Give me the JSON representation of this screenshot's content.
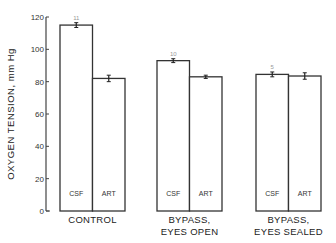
{
  "chart_data": {
    "type": "bar",
    "title": "",
    "xlabel": "",
    "ylabel": "OXYGEN TENSION, mm Hg",
    "ylim": [
      0,
      120
    ],
    "yticks": [
      0,
      20,
      40,
      60,
      80,
      100,
      120
    ],
    "grid": false,
    "legend": null,
    "groups": [
      "CONTROL",
      "BYPASS, EYES OPEN",
      "BYPASS, EYES SEALED"
    ],
    "group_label_lines": [
      [
        "CONTROL"
      ],
      [
        "BYPASS,",
        "EYES OPEN"
      ],
      [
        "BYPASS,",
        "EYES SEALED"
      ]
    ],
    "bar_labels": [
      "CSF",
      "ART"
    ],
    "series": [
      {
        "name": "CSF",
        "values": [
          115,
          93,
          84.5
        ],
        "errors": [
          1.5,
          1.2,
          1.5
        ],
        "n": [
          "11",
          "10",
          "5"
        ]
      },
      {
        "name": "ART",
        "values": [
          82,
          83,
          83.5
        ],
        "errors": [
          2,
          1,
          2
        ]
      }
    ]
  }
}
